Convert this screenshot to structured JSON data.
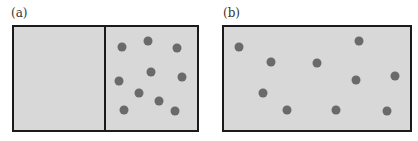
{
  "panels": [
    {
      "label": "(a)",
      "label_pos": [
        11,
        6
      ],
      "box": {
        "x": 12,
        "y": 25,
        "w": 187,
        "h": 107
      },
      "divider_x": 104,
      "dots": [
        [
          122,
          47
        ],
        [
          148,
          41
        ],
        [
          177,
          48
        ],
        [
          151,
          72
        ],
        [
          182,
          77
        ],
        [
          119,
          81
        ],
        [
          139,
          93
        ],
        [
          159,
          101
        ],
        [
          124,
          110
        ],
        [
          175,
          111
        ]
      ]
    },
    {
      "label": "(b)",
      "label_pos": [
        223,
        6
      ],
      "box": {
        "x": 222,
        "y": 25,
        "w": 190,
        "h": 107
      },
      "divider_x": null,
      "dots": [
        [
          239,
          47
        ],
        [
          359,
          41
        ],
        [
          271,
          62
        ],
        [
          317,
          63
        ],
        [
          356,
          80
        ],
        [
          395,
          76
        ],
        [
          263,
          93
        ],
        [
          287,
          110
        ],
        [
          336,
          110
        ],
        [
          387,
          111
        ]
      ]
    }
  ],
  "colors": {
    "fill": "#d8d8d8",
    "border": "#1a1a1a",
    "dot": "#6a6a6a"
  }
}
